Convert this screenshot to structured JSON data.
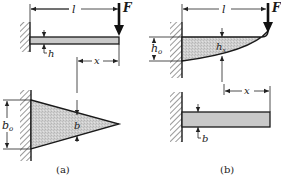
{
  "figure": {
    "panel_a": {
      "caption": "(a)",
      "elevation": {
        "length_label": "l",
        "force_label": "F",
        "thickness_label": "h",
        "position_label": "x"
      },
      "plan": {
        "root_width_label": "b",
        "root_width_subscript": "o",
        "width_label": "b"
      }
    },
    "panel_b": {
      "caption": "(b)",
      "elevation": {
        "length_label": "l",
        "force_label": "F",
        "root_height_label": "h",
        "root_height_subscript": "o",
        "height_label": "h",
        "height_subscript": "x"
      },
      "plan": {
        "position_label": "x",
        "width_label": "b"
      }
    }
  }
}
